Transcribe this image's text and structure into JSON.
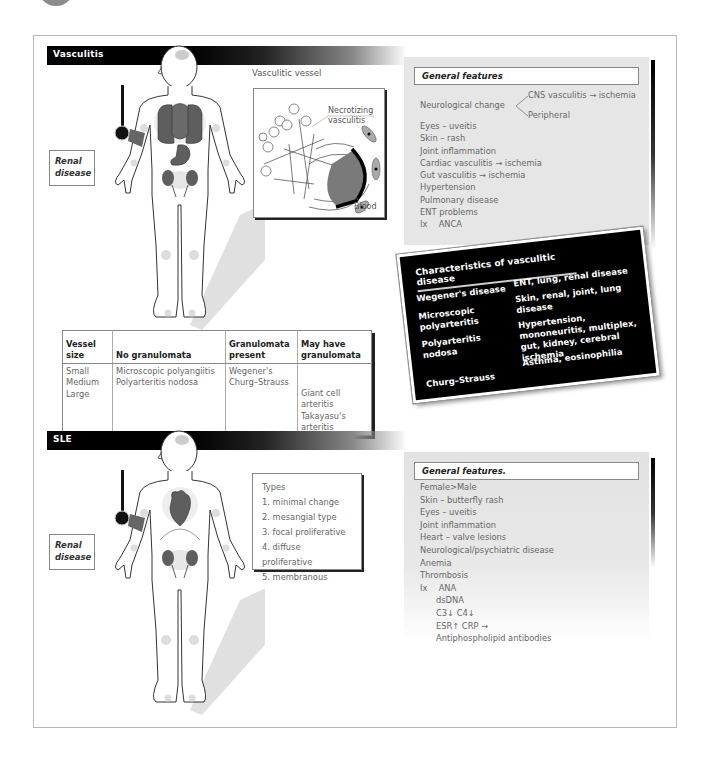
{
  "sections": {
    "vasculitis": {
      "title": "Vasculitis",
      "renal_label": "Renal disease",
      "vessel_diagram": {
        "title": "Vasculitic vessel",
        "labels": [
          "Necrotizing vasculitis",
          "Blood"
        ]
      },
      "general_features": {
        "heading": "General features",
        "neurological": {
          "label": "Neurological change",
          "branch_central": "CNS vasculitis → ischemia",
          "branch_peripheral": "Peripheral"
        },
        "items": [
          "Eyes – uveitis",
          "Skin – rash",
          "Joint inflammation",
          "Cardiac vasculitis → ischemia",
          "Gut vasculitis → ischemia",
          "Hypertension",
          "Pulmonary disease",
          "ENT problems"
        ],
        "investigations": {
          "prefix": "Ix",
          "tests": [
            "ANCA"
          ]
        }
      },
      "characteristics": {
        "title": "Characteristics of vasculitic disease",
        "rows": [
          {
            "disease": "Wegener's disease",
            "features": "ENT, lung, renal disease"
          },
          {
            "disease": "Microscopic polyarteritis",
            "features": "Skin, renal, joint, lung disease"
          },
          {
            "disease": "Polyarteritis nodosa",
            "features": "Hypertension, mononeuritis, multiplex, gut, kidney, cerebral ischemia"
          },
          {
            "disease": "Churg–Strauss",
            "features": "Asthma, eosinophilia"
          }
        ]
      },
      "vessel_table": {
        "headers": [
          "Vessel size",
          "No granulomata",
          "Granulomata present",
          "May have granulomata"
        ],
        "sizes": [
          "Small",
          "Medium",
          "Large"
        ],
        "no_granulomata": [
          "Microscopic polyangiitis",
          "Polyarteritis nodosa"
        ],
        "granulomata_present": [
          "Wegener's",
          "Churg–Strauss"
        ],
        "may_have_granulomata": [
          "Giant cell arteritis",
          "Takayasu's arteritis"
        ]
      }
    },
    "sle": {
      "title": "SLE",
      "renal_label": "Renal disease",
      "types": {
        "heading": "Types",
        "items": [
          "1. minimal change",
          "2. mesangial type",
          "3. focal proliferative",
          "4. diffuse proliferative",
          "5. membranous"
        ]
      },
      "general_features": {
        "heading": "General features.",
        "items": [
          "Female>Male",
          "Skin – butterfly rash",
          "Eyes – uveitis",
          "Joint inflammation",
          "Heart – valve lesions",
          "Neurological/psychiatric disease",
          "Anemia",
          "Thrombosis"
        ],
        "investigations": {
          "prefix": "Ix",
          "tests": [
            "ANA",
            "dsDNA",
            "C3↓ C4↓",
            "ESR↑ CRP →",
            "Antiphospholipid antibodies"
          ]
        }
      }
    }
  },
  "colors": {
    "organ": "#5e5e5e",
    "panel": "#e6e6e6",
    "bar": "#000000",
    "text": "#666666"
  }
}
